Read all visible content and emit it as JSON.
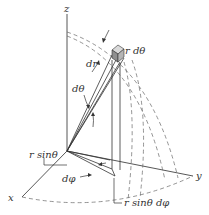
{
  "diagram": {
    "axes": {
      "z": "z",
      "x": "x",
      "y": "y"
    },
    "labels": {
      "dr": "dr",
      "r_dtheta": "r dθ",
      "dtheta": "dθ",
      "r_sin_theta": "r sinθ",
      "dphi": "dφ",
      "r_sin_theta_dphi": "r sinθ dφ"
    },
    "colors": {
      "line": "#333333",
      "dashed": "#666666",
      "cube_face_light": "#d9d9d9",
      "cube_face_mid": "#b5b5b5",
      "cube_face_dark": "#8f8f8f"
    }
  }
}
